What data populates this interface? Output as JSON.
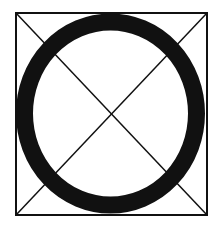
{
  "diagram": {
    "colors": {
      "background": "#ffffff",
      "stroke": "#111111"
    },
    "square": {
      "x": 16,
      "y": 13,
      "width": 191,
      "height": 202,
      "stroke_width": 2
    },
    "diagonals": [
      {
        "x1": 16,
        "y1": 13,
        "x2": 207,
        "y2": 215
      },
      {
        "x1": 207,
        "y1": 13,
        "x2": 16,
        "y2": 215
      }
    ],
    "ring": {
      "cx": 110.5,
      "cy": 113.5,
      "rx": 86,
      "ry": 91.5,
      "stroke_width": 17
    }
  }
}
